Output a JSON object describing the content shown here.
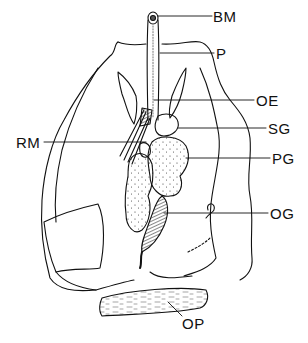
{
  "figure": {
    "type": "anatomical line drawing",
    "labels": [
      {
        "id": "BM",
        "text": "BM",
        "x": 213,
        "y": 16
      },
      {
        "id": "P",
        "text": "P",
        "x": 216,
        "y": 53
      },
      {
        "id": "OE",
        "text": "OE",
        "x": 256,
        "y": 100
      },
      {
        "id": "RM",
        "text": "RM",
        "x": 16,
        "y": 136
      },
      {
        "id": "SG",
        "text": "SG",
        "x": 268,
        "y": 128
      },
      {
        "id": "PG",
        "text": "PG",
        "x": 272,
        "y": 158
      },
      {
        "id": "OG",
        "text": "OG",
        "x": 270,
        "y": 212
      },
      {
        "id": "OP",
        "text": "OP",
        "x": 182,
        "y": 320
      }
    ],
    "colors": {
      "ink": "#111111",
      "background": "#ffffff"
    }
  }
}
